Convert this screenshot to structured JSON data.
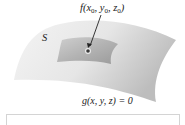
{
  "figure": {
    "point_label": {
      "func": "f(",
      "x": "x",
      "x_sub": "0",
      "sep1": ", ",
      "y": "y",
      "y_sub": "0",
      "sep2": ", ",
      "z": "z",
      "z_sub": "0",
      "close": ")"
    },
    "surface_label": "S",
    "constraint_label": "g(x, y, z) = 0",
    "colors": {
      "surface_light": "#f2f2f2",
      "surface_dark": "#c8c8c8",
      "patch_light": "#b8b8b8",
      "patch_dark": "#8f8f8f",
      "point": "#3a3a3a",
      "arrow": "#222222",
      "frame": "#d4d4d4"
    }
  }
}
